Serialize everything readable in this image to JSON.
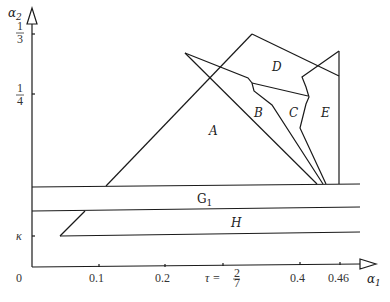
{
  "axes": {
    "x_label": "α",
    "x_label_sub": "1",
    "y_label": "α",
    "y_label_sub": "2",
    "origin": "0",
    "x_ticks": [
      "0.1",
      "0.2",
      "τ =",
      "0.4",
      "0.46"
    ],
    "tau_fraction": {
      "num": "2",
      "den": "7"
    },
    "y_ticks": [
      {
        "num": "1",
        "den": "3"
      },
      {
        "num": "1",
        "den": "4"
      }
    ],
    "y_kappa": "κ"
  },
  "regions": {
    "A": "A",
    "B": "B",
    "C": "C",
    "D": "D",
    "E": "E",
    "G1": "G",
    "G1_sub": "1",
    "H": "H"
  },
  "colors": {
    "line": "#1a1a1a",
    "background": "#ffffff"
  }
}
